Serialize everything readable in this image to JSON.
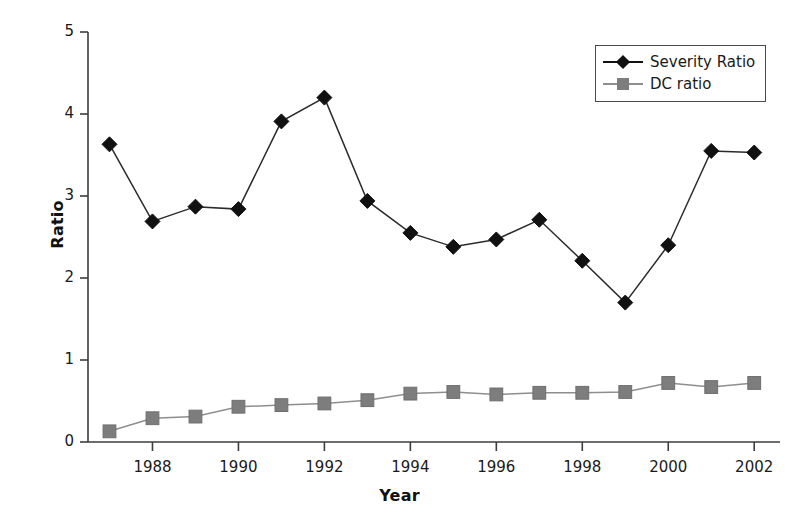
{
  "chart_data": {
    "type": "line",
    "title": "",
    "xlabel": "Year",
    "ylabel": "Ratio",
    "xlim": [
      1986.5,
      2002.6
    ],
    "ylim": [
      0,
      5
    ],
    "grid": false,
    "legend_position": "upper-right",
    "x": [
      1987,
      1988,
      1989,
      1990,
      1991,
      1992,
      1993,
      1994,
      1995,
      1996,
      1997,
      1998,
      1999,
      2000,
      2001,
      2002
    ],
    "xticks": [
      1988,
      1990,
      1992,
      1994,
      1996,
      1998,
      2000,
      2002
    ],
    "xtick_labels": [
      "1988",
      "1990",
      "1992",
      "1994",
      "1996",
      "1998",
      "2000",
      "2002"
    ],
    "yticks": [
      0,
      1,
      2,
      3,
      4,
      5
    ],
    "ytick_labels": [
      "0",
      "1",
      "2",
      "3",
      "4",
      "5"
    ],
    "series": [
      {
        "name": "Severity Ratio",
        "marker": "diamond",
        "color": "#111111",
        "values": [
          3.63,
          2.69,
          2.87,
          2.84,
          3.91,
          4.2,
          2.94,
          2.55,
          2.38,
          2.47,
          2.71,
          2.21,
          1.7,
          2.4,
          3.55,
          3.53
        ]
      },
      {
        "name": "DC ratio",
        "marker": "square",
        "color": "#7d7d7d",
        "values": [
          0.13,
          0.29,
          0.31,
          0.43,
          0.45,
          0.47,
          0.51,
          0.59,
          0.61,
          0.58,
          0.6,
          0.6,
          0.61,
          0.72,
          0.67,
          0.72
        ]
      }
    ]
  },
  "legend": {
    "items": [
      {
        "label": "Severity Ratio"
      },
      {
        "label": "DC ratio"
      }
    ]
  },
  "axes": {
    "x_title": "Year",
    "y_title": "Ratio"
  }
}
